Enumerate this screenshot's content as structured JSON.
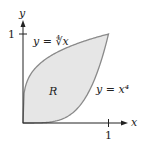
{
  "figure": {
    "axes": {
      "x_label": "x",
      "y_label": "y",
      "x_tick": "1",
      "y_tick": "1"
    },
    "region_label": "R",
    "curves": [
      {
        "name": "upper",
        "label": "y = ∜x",
        "expr": "x^(1/4)"
      },
      {
        "name": "lower",
        "label": "y = x⁴",
        "expr": "x^4"
      }
    ],
    "colors": {
      "fill": "#e6e6e6",
      "stroke": "#8a8a8a",
      "axis": "#222222"
    }
  }
}
